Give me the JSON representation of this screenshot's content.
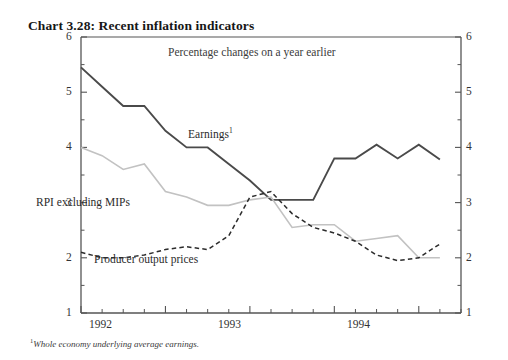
{
  "chart_data": {
    "type": "line",
    "title": "Chart 3.28: Recent inflation indicators",
    "subtitle": "Percentage changes on a year earlier",
    "footnote": "Whole economy underlying average earnings.",
    "footnote_marker": "1",
    "xlabel": "",
    "ylabel": "",
    "ylim": [
      1,
      6
    ],
    "y_ticks": [
      1,
      2,
      3,
      4,
      5,
      6
    ],
    "y_tick_labels": [
      "1",
      "2",
      "3",
      "4",
      "5",
      "6"
    ],
    "y_minor_ticks": [
      1.5,
      2.5,
      3.5,
      4.5,
      5.5
    ],
    "right_axis": true,
    "right_y_tick_labels": [
      "1",
      "2",
      "3",
      "4",
      "5",
      "6"
    ],
    "grid": false,
    "legend_position": "inline-annotations",
    "x_year_labels": [
      "1992",
      "1993",
      "1994"
    ],
    "x_year_positions": [
      1.5,
      5.5,
      9.5
    ],
    "x_quarter_count": 18,
    "xlim": [
      0,
      18
    ],
    "series": [
      {
        "name": "Earnings",
        "label": "Earnings",
        "label_superscript": "1",
        "style": "solid",
        "color": "#4a4a4a",
        "width": 1.9,
        "x": [
          0,
          1,
          2,
          3,
          4,
          5,
          6,
          7,
          8,
          9,
          10,
          11,
          12,
          13,
          14,
          15,
          16,
          17
        ],
        "values": [
          5.45,
          5.1,
          4.75,
          4.75,
          4.3,
          4.0,
          4.0,
          3.7,
          3.4,
          3.05,
          3.05,
          3.05,
          3.8,
          3.8,
          4.05,
          3.8,
          4.05,
          3.78
        ]
      },
      {
        "name": "RPI excluding MIPs",
        "label": "RPI excluding MIPs",
        "style": "solid",
        "color": "#c2c2c2",
        "width": 1.6,
        "x": [
          0,
          1,
          2,
          3,
          4,
          5,
          6,
          7,
          8,
          9,
          10,
          11,
          12,
          13,
          14,
          15,
          16,
          17
        ],
        "values": [
          4.0,
          3.85,
          3.6,
          3.7,
          3.2,
          3.1,
          2.95,
          2.95,
          3.05,
          3.1,
          2.55,
          2.6,
          2.6,
          2.3,
          2.35,
          2.4,
          2.0,
          2.0
        ]
      },
      {
        "name": "Producer output prices",
        "label": "Producer output prices",
        "style": "dashed",
        "color": "#2b2b2b",
        "width": 1.5,
        "x": [
          0,
          1,
          2,
          3,
          4,
          5,
          6,
          7,
          8,
          9,
          10,
          11,
          12,
          13,
          14,
          15,
          16,
          17
        ],
        "values": [
          2.1,
          2.0,
          2.0,
          2.05,
          2.15,
          2.2,
          2.15,
          2.4,
          3.1,
          3.2,
          2.8,
          2.55,
          2.45,
          2.3,
          2.05,
          1.95,
          2.0,
          2.25
        ]
      }
    ],
    "annotations": [
      {
        "text": "Percentage changes on a year earlier",
        "x_px": 168,
        "y_px": 46
      },
      {
        "text": "Earnings",
        "x_px": 188,
        "y_px": 133
      },
      {
        "text": "RPI excluding MIPs",
        "x_px": 36,
        "y_px": 202
      },
      {
        "text": "Producer output prices",
        "x_px": 94,
        "y_px": 259
      }
    ]
  },
  "axis_labels": {
    "left": [
      "6",
      "5",
      "4",
      "3",
      "2",
      "1"
    ],
    "right": [
      "6",
      "5",
      "4",
      "3",
      "2",
      "1"
    ],
    "x": [
      "1992",
      "1993",
      "1994"
    ]
  }
}
